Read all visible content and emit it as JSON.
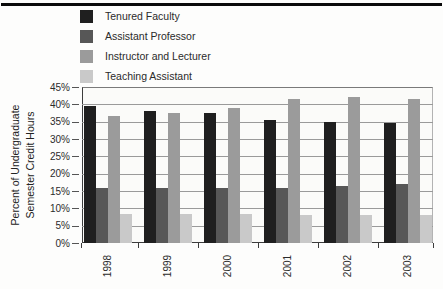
{
  "y_axis": {
    "title_line1": "Percent of Undergraduate",
    "title_line2": "Semester Credit Hours",
    "tick_labels": [
      "45%",
      "40%",
      "35%",
      "30%",
      "25%",
      "20%",
      "15%",
      "10%",
      "5%",
      "0%"
    ]
  },
  "x_axis": {
    "tick_labels": [
      "1998",
      "1999",
      "2000",
      "2001",
      "2002",
      "2003"
    ]
  },
  "legend": {
    "items": [
      {
        "label": "Tenured Faculty",
        "color": "#1f1f1f"
      },
      {
        "label": "Assistant Professor",
        "color": "#575757"
      },
      {
        "label": "Instructor and Lecturer",
        "color": "#9b9b9b"
      },
      {
        "label": "Teaching Assistant",
        "color": "#c9c9c9"
      }
    ]
  },
  "chart_data": {
    "type": "bar",
    "title": "",
    "categories": [
      "1998",
      "1999",
      "2000",
      "2001",
      "2002",
      "2003"
    ],
    "series": [
      {
        "name": "Tenured Faculty",
        "color": "#1f1f1f",
        "values": [
          39.5,
          38,
          37.5,
          35.5,
          35,
          34.5
        ]
      },
      {
        "name": "Assistant Professor",
        "color": "#575757",
        "values": [
          16,
          16,
          16,
          16,
          16.5,
          17
        ]
      },
      {
        "name": "Instructor and Lecturer",
        "color": "#9b9b9b",
        "values": [
          36.5,
          37.5,
          39,
          41.5,
          42,
          41.5
        ]
      },
      {
        "name": "Teaching Assistant",
        "color": "#c9c9c9",
        "values": [
          8.5,
          8.5,
          8.5,
          8,
          8,
          8
        ]
      }
    ],
    "xlabel": "",
    "ylabel": "Percent of Undergraduate Semester Credit Hours",
    "ylim": [
      0,
      45
    ],
    "ytick_step": 5,
    "grid": true,
    "legend_position": "top-left"
  }
}
